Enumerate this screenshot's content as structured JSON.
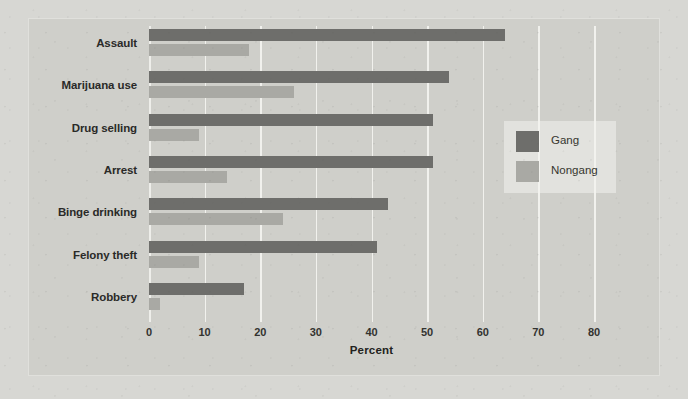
{
  "chart_data": {
    "type": "bar",
    "orientation": "horizontal",
    "title": "",
    "xlabel": "Percent",
    "ylabel": "",
    "xlim": [
      0,
      80
    ],
    "xticks": [
      0,
      10,
      20,
      30,
      40,
      50,
      60,
      70,
      80
    ],
    "grid": "vertical",
    "legend_position": "upper-right-inside",
    "categories": [
      "Assault",
      "Marijuana use",
      "Drug selling",
      "Arrest",
      "Binge drinking",
      "Felony theft",
      "Robbery"
    ],
    "series": [
      {
        "name": "Gang",
        "color": "#6e6e6b",
        "values": [
          64,
          54,
          51,
          51,
          43,
          41,
          17
        ]
      },
      {
        "name": "Nongang",
        "color": "#a9a9a4",
        "values": [
          18,
          26,
          9,
          14,
          24,
          9,
          2
        ]
      }
    ]
  },
  "colors": {
    "figure_background": "#d7d7d3",
    "plot_background": "#cfcfca",
    "gridline": "#f2f2ee",
    "gang": "#6e6e6b",
    "nongang": "#a9a9a4",
    "text": "#2a2a28"
  }
}
